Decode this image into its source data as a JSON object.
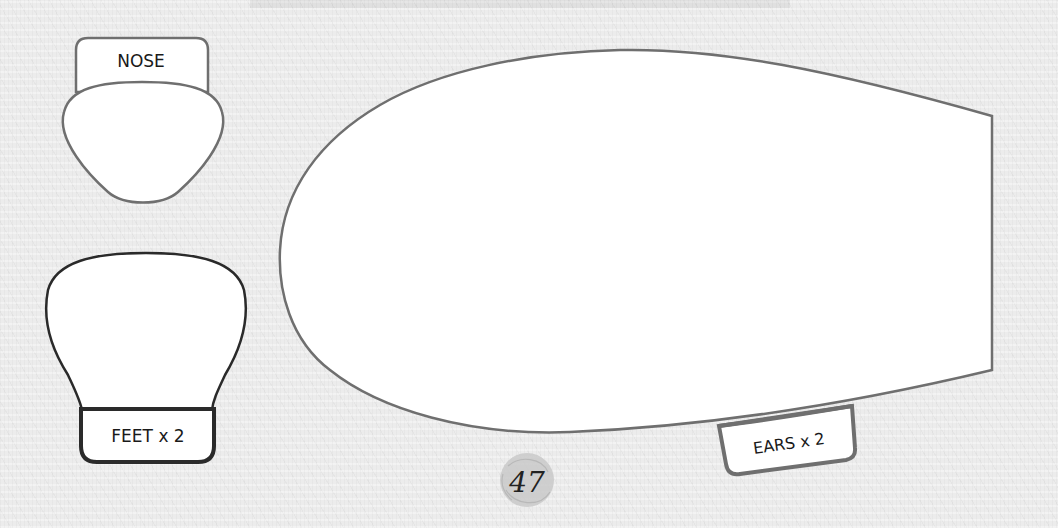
{
  "document": {
    "type": "sewing pattern template page",
    "page_number": "47"
  },
  "pieces": {
    "nose": {
      "label": "NOSE"
    },
    "feet": {
      "label": "FEET x 2"
    },
    "ears": {
      "label": "EARS x 2"
    },
    "body": {
      "label": ""
    }
  },
  "colors": {
    "background": "#ececec",
    "piece_fill": "#ffffff",
    "outline_grey": "#6f6f6f",
    "outline_dark": "#2a2a2a",
    "page_badge": "#c9c9c9",
    "text": "#1a1a1a"
  }
}
